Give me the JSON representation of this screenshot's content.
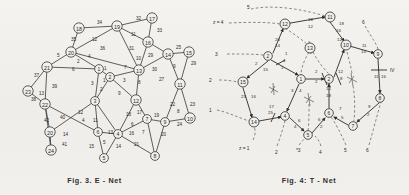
{
  "page": {
    "background": "#f1f0ed",
    "ink": "#2b2a28",
    "width": 409,
    "height": 195
  },
  "figures": [
    {
      "id": "e-net",
      "caption": "Fig. 3.  E - Net",
      "node_label_style": "circled-number",
      "nodes": [
        {
          "id": "n17",
          "label": "17",
          "x": 152,
          "y": 18
        },
        {
          "id": "n18",
          "label": "18",
          "x": 79,
          "y": 28
        },
        {
          "id": "n19",
          "label": "19",
          "x": 117,
          "y": 26
        },
        {
          "id": "n16",
          "label": "16",
          "x": 148,
          "y": 42
        },
        {
          "id": "n20",
          "label": "20",
          "x": 71,
          "y": 52
        },
        {
          "id": "n14",
          "label": "14",
          "x": 168,
          "y": 54
        },
        {
          "id": "n15",
          "label": "15",
          "x": 189,
          "y": 52
        },
        {
          "id": "n21",
          "label": "21",
          "x": 47,
          "y": 67
        },
        {
          "id": "n1",
          "label": "1",
          "x": 99,
          "y": 69
        },
        {
          "id": "n13",
          "label": "13",
          "x": 139,
          "y": 70
        },
        {
          "id": "n2",
          "label": "2",
          "x": 110,
          "y": 77
        },
        {
          "id": "n11",
          "label": "11",
          "x": 180,
          "y": 84
        },
        {
          "id": "n23",
          "label": "23",
          "x": 28,
          "y": 91
        },
        {
          "id": "n22",
          "label": "22",
          "x": 45,
          "y": 104
        },
        {
          "id": "n3",
          "label": "3",
          "x": 95,
          "y": 101
        },
        {
          "id": "n12",
          "label": "12",
          "x": 136,
          "y": 100
        },
        {
          "id": "n7",
          "label": "7",
          "x": 147,
          "y": 119
        },
        {
          "id": "n10",
          "label": "10",
          "x": 190,
          "y": 118
        },
        {
          "id": "n9",
          "label": "9",
          "x": 165,
          "y": 122
        },
        {
          "id": "n24",
          "label": "24",
          "x": 50,
          "y": 132
        },
        {
          "id": "n6",
          "label": "6",
          "x": 98,
          "y": 132
        },
        {
          "id": "n4",
          "label": "4",
          "x": 118,
          "y": 134
        },
        {
          "id": "n25",
          "label": "25",
          "x": 51,
          "y": 150
        },
        {
          "id": "n5",
          "label": "5",
          "x": 104,
          "y": 158
        },
        {
          "id": "n8",
          "label": "8",
          "x": 155,
          "y": 156
        }
      ],
      "edges": [
        {
          "from": "n18",
          "to": "n19",
          "label": "34"
        },
        {
          "from": "n19",
          "to": "n17",
          "label": "32"
        },
        {
          "from": "n17",
          "to": "n16",
          "label": "33"
        },
        {
          "from": "n19",
          "to": "n16",
          "label": "11"
        },
        {
          "from": "n18",
          "to": "n20",
          "label": "35"
        },
        {
          "from": "n19",
          "to": "n20",
          "label": "12"
        },
        {
          "from": "n19",
          "to": "n20b",
          "label": "36"
        },
        {
          "from": "n19",
          "to": "n16b",
          "label": "31"
        },
        {
          "from": "n16",
          "to": "n13",
          "label": "29"
        },
        {
          "from": "n16",
          "to": "n14",
          "label": "10"
        },
        {
          "from": "n14",
          "to": "n15",
          "label": "25"
        },
        {
          "from": "n15",
          "to": "n11",
          "label": "29b"
        },
        {
          "from": "n14",
          "to": "n11",
          "label": "9"
        },
        {
          "from": "n14",
          "to": "n11b",
          "label": "27"
        },
        {
          "from": "n13",
          "to": "n14",
          "label": "30"
        },
        {
          "from": "n20",
          "to": "n21",
          "label": "5"
        },
        {
          "from": "n20",
          "to": "n1",
          "label": "4"
        },
        {
          "from": "n20",
          "to": "n1b",
          "label": "2"
        },
        {
          "from": "n21",
          "to": "n1",
          "label": "6"
        },
        {
          "from": "n21",
          "to": "n23",
          "label": "37"
        },
        {
          "from": "n21",
          "to": "n22",
          "label": "39"
        },
        {
          "from": "n23",
          "to": "n22",
          "label": "13"
        },
        {
          "from": "n23",
          "to": "n22b",
          "label": "38"
        },
        {
          "from": "n1",
          "to": "n2",
          "label": "1"
        },
        {
          "from": "n2",
          "to": "n13",
          "label": "7"
        },
        {
          "from": "n1",
          "to": "n3",
          "label": "3"
        },
        {
          "from": "n2",
          "to": "n3",
          "label": "1b"
        },
        {
          "from": "n2",
          "to": "n3b",
          "label": "2b"
        },
        {
          "from": "n2",
          "to": "n12",
          "label": "3b"
        },
        {
          "from": "n13",
          "to": "n12",
          "label": "8"
        },
        {
          "from": "n2",
          "to": "n12b",
          "label": "9b"
        },
        {
          "from": "n22",
          "to": "n6",
          "label": "40"
        },
        {
          "from": "n22",
          "to": "n25",
          "label": "42"
        },
        {
          "from": "n22",
          "to": "n24",
          "label": "14"
        },
        {
          "from": "n24",
          "to": "n25",
          "label": "41"
        },
        {
          "from": "n3",
          "to": "n24",
          "label": "12b"
        },
        {
          "from": "n3",
          "to": "n6",
          "label": "4b"
        },
        {
          "from": "n3",
          "to": "n6b",
          "label": "11b"
        },
        {
          "from": "n6",
          "to": "n4",
          "label": "13b"
        },
        {
          "from": "n24",
          "to": "n6",
          "label": "18"
        },
        {
          "from": "n12",
          "to": "n4",
          "label": "18b"
        },
        {
          "from": "n12",
          "to": "n7",
          "label": "17"
        },
        {
          "from": "n4",
          "to": "n7",
          "label": "6b"
        },
        {
          "from": "n4",
          "to": "n7b",
          "label": "16"
        },
        {
          "from": "n7",
          "to": "n9",
          "label": "19"
        },
        {
          "from": "n9",
          "to": "n10",
          "label": "24"
        },
        {
          "from": "n11",
          "to": "n9",
          "label": "22"
        },
        {
          "from": "n11",
          "to": "n10",
          "label": "23"
        },
        {
          "from": "n9",
          "to": "n10b",
          "label": "8b"
        },
        {
          "from": "n7",
          "to": "n8",
          "label": "7b"
        },
        {
          "from": "n9",
          "to": "n8",
          "label": "20"
        },
        {
          "from": "n4",
          "to": "n8",
          "label": "21"
        },
        {
          "from": "n6",
          "to": "n5",
          "label": "15"
        },
        {
          "from": "n4",
          "to": "n5",
          "label": "14b"
        },
        {
          "from": "n6",
          "to": "n5b",
          "label": "5b"
        }
      ],
      "edge_labels": [
        "34",
        "32",
        "33",
        "11",
        "35",
        "12",
        "36",
        "31",
        "29",
        "10",
        "25",
        "29",
        "9",
        "27",
        "30",
        "5",
        "4",
        "2",
        "6",
        "37",
        "39",
        "13",
        "38",
        "1",
        "7",
        "3",
        "1",
        "2",
        "3",
        "8",
        "9",
        "40",
        "42",
        "14",
        "41",
        "12",
        "4",
        "11",
        "13",
        "18",
        "18",
        "17",
        "6",
        "16",
        "19",
        "24",
        "22",
        "23",
        "8",
        "7",
        "20",
        "21",
        "15",
        "14",
        "5"
      ]
    },
    {
      "id": "t-net",
      "caption": "Fig. 4:   T - Net",
      "node_label_style": "circled-number",
      "nodes": [
        {
          "id": "t11",
          "label": "11",
          "x": 125,
          "y": 17
        },
        {
          "id": "t12",
          "label": "12",
          "x": 80,
          "y": 24
        },
        {
          "id": "t13",
          "label": "13",
          "x": 105,
          "y": 48
        },
        {
          "id": "t10",
          "label": "10",
          "x": 141,
          "y": 45
        },
        {
          "id": "t2",
          "label": "2",
          "x": 63,
          "y": 56
        },
        {
          "id": "t9",
          "label": "9",
          "x": 173,
          "y": 54
        },
        {
          "id": "t15",
          "label": "15",
          "x": 38,
          "y": 82
        },
        {
          "id": "t3",
          "label": "3",
          "x": 68,
          "y": 89
        },
        {
          "id": "t1",
          "label": "1",
          "x": 96,
          "y": 79
        },
        {
          "id": "t2b",
          "label": "2",
          "x": 124,
          "y": 79
        },
        {
          "id": "t7b",
          "label": "7",
          "x": 147,
          "y": 79
        },
        {
          "id": "t8",
          "label": "8",
          "x": 175,
          "y": 98
        },
        {
          "id": "t4b",
          "label": "4",
          "x": 104,
          "y": 99
        },
        {
          "id": "t14",
          "label": "14",
          "x": 49,
          "y": 122
        },
        {
          "id": "t4",
          "label": "4",
          "x": 80,
          "y": 116
        },
        {
          "id": "t6",
          "label": "6",
          "x": 124,
          "y": 113
        },
        {
          "id": "t7",
          "label": "7",
          "x": 148,
          "y": 126
        },
        {
          "id": "t5",
          "label": "5",
          "x": 103,
          "y": 135
        }
      ],
      "edges": [
        {
          "from": "t12",
          "to": "t11",
          "label": "18"
        },
        {
          "from": "t12",
          "to": "t11b",
          "label": "12"
        },
        {
          "from": "t11",
          "to": "t10",
          "label": "18b"
        },
        {
          "from": "t11",
          "to": "t10b",
          "label": "16"
        },
        {
          "from": "t11",
          "to": "t10c",
          "label": "12b"
        },
        {
          "from": "t10",
          "to": "t9",
          "label": "11"
        },
        {
          "from": "t10",
          "to": "t9b",
          "label": "14"
        },
        {
          "from": "t12",
          "to": "t2",
          "label": "20"
        },
        {
          "from": "t12",
          "to": "t2b",
          "label": "14b"
        },
        {
          "from": "t2",
          "to": "t1",
          "label": "1"
        },
        {
          "from": "t2",
          "to": "t1b",
          "label": "4"
        },
        {
          "from": "t2",
          "to": "t1c",
          "label": "1b"
        },
        {
          "from": "t2",
          "to": "t15",
          "label": "2"
        },
        {
          "from": "t2",
          "to": "t15b",
          "label": "15"
        },
        {
          "from": "t15",
          "to": "t14",
          "label": "23"
        },
        {
          "from": "t15",
          "to": "t14b",
          "label": "16b"
        },
        {
          "from": "t14",
          "to": "t4",
          "label": "17"
        },
        {
          "from": "t14",
          "to": "t4b",
          "label": "25"
        },
        {
          "from": "t1",
          "to": "t2b",
          "label": "2b"
        },
        {
          "from": "t1",
          "to": "t2c",
          "label": "2c"
        },
        {
          "from": "t1",
          "to": "t4",
          "label": "3"
        },
        {
          "from": "t1",
          "to": "t4c",
          "label": "4b"
        },
        {
          "from": "t2b",
          "to": "t10",
          "label": "12c"
        },
        {
          "from": "t2b",
          "to": "t10b",
          "label": "12d"
        },
        {
          "from": "t2b",
          "to": "t8",
          "label": "8"
        },
        {
          "from": "t2b",
          "to": "t6",
          "label": "12e"
        },
        {
          "from": "t2b",
          "to": "t6b",
          "label": "18c"
        },
        {
          "from": "t9",
          "to": "t8",
          "label": "11b"
        },
        {
          "from": "t9",
          "to": "t8b",
          "label": "16c"
        },
        {
          "from": "t8",
          "to": "t7",
          "label": "9"
        },
        {
          "from": "t8",
          "to": "t7b",
          "label": "2d"
        },
        {
          "from": "t6",
          "to": "t7",
          "label": "7"
        },
        {
          "from": "t6",
          "to": "t7c",
          "label": "5"
        },
        {
          "from": "t4",
          "to": "t5",
          "label": "6"
        },
        {
          "from": "t4",
          "to": "t5b",
          "label": "4c"
        },
        {
          "from": "t6",
          "to": "t5",
          "label": "6b"
        },
        {
          "from": "t6",
          "to": "t5c",
          "label": "2e"
        }
      ],
      "external_labels": [
        {
          "text": "5",
          "x": 42,
          "y": 7
        },
        {
          "text": "z = 4",
          "x": 11,
          "y": 22
        },
        {
          "text": "3",
          "x": 10,
          "y": 54
        },
        {
          "text": "2",
          "x": 5,
          "y": 80
        },
        {
          "text": "1",
          "x": 5,
          "y": 110
        },
        {
          "text": "z = 1",
          "x": 38,
          "y": 148
        },
        {
          "text": "6",
          "x": 158,
          "y": 22
        },
        {
          "text": "IV",
          "x": 183,
          "y": 75
        },
        {
          "text": "2",
          "x": 73,
          "y": 152
        },
        {
          "text": "*3",
          "x": 94,
          "y": 150
        },
        {
          "text": "4",
          "x": 116,
          "y": 152
        },
        {
          "text": "5",
          "x": 141,
          "y": 150
        },
        {
          "text": "6",
          "x": 163,
          "y": 150
        }
      ],
      "dashed_guides": "curved dashed flow lines radiating from network nodes to outer labels"
    }
  ]
}
